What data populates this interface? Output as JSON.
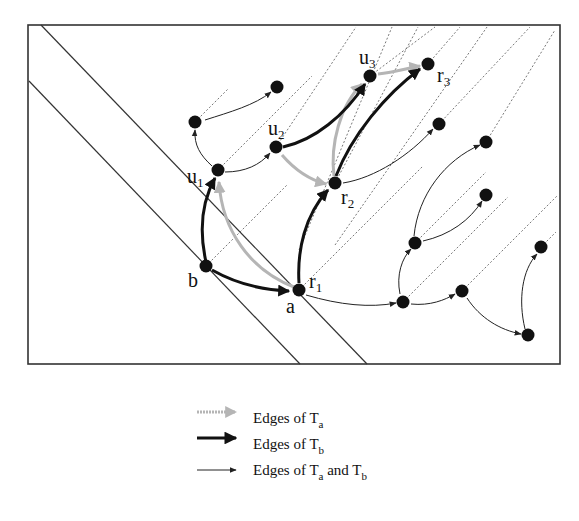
{
  "diagram": {
    "frame": {
      "x": 28,
      "y": 25,
      "w": 532,
      "h": 339
    },
    "colors": {
      "node": "#111111",
      "frame": "#333333",
      "gray_edge": "#b5b5b5",
      "black_edge": "#111111",
      "thin_edge": "#222222",
      "dotted": "#555555"
    },
    "nodes": [
      {
        "id": "b",
        "x": 206,
        "y": 266,
        "label": "b",
        "lx": 188,
        "ly": 287
      },
      {
        "id": "a",
        "x": 299,
        "y": 290,
        "label": "a",
        "lx": 286,
        "ly": 313
      },
      {
        "id": "r1",
        "x": 299,
        "y": 290,
        "label": "r",
        "sub": "1",
        "lx": 309,
        "ly": 288
      },
      {
        "id": "u1",
        "x": 218,
        "y": 170,
        "label": "u",
        "sub": "1",
        "lx": 187,
        "ly": 183
      },
      {
        "id": "u2",
        "x": 276,
        "y": 147,
        "label": "u",
        "sub": "2",
        "lx": 268,
        "ly": 135
      },
      {
        "id": "r2",
        "x": 335,
        "y": 183,
        "label": "r",
        "sub": "2",
        "lx": 341,
        "ly": 204
      },
      {
        "id": "u3",
        "x": 370,
        "y": 76,
        "label": "u",
        "sub": "3",
        "lx": 359,
        "ly": 64
      },
      {
        "id": "r3",
        "x": 428,
        "y": 64,
        "label": "r",
        "sub": "3",
        "lx": 437,
        "ly": 82
      },
      {
        "id": "n1",
        "x": 195,
        "y": 122
      },
      {
        "id": "n2",
        "x": 277,
        "y": 87
      },
      {
        "id": "n3",
        "x": 439,
        "y": 124
      },
      {
        "id": "n4",
        "x": 486,
        "y": 142
      },
      {
        "id": "n5",
        "x": 486,
        "y": 195
      },
      {
        "id": "n6",
        "x": 415,
        "y": 243
      },
      {
        "id": "n7",
        "x": 403,
        "y": 302
      },
      {
        "id": "n8",
        "x": 462,
        "y": 291
      },
      {
        "id": "n9",
        "x": 541,
        "y": 247
      },
      {
        "id": "n10",
        "x": 528,
        "y": 335
      }
    ],
    "solid_diagonals": [
      {
        "x1": 41,
        "y1": 25,
        "x2": 367,
        "y2": 364
      },
      {
        "x1": 29,
        "y1": 81,
        "x2": 300,
        "y2": 364
      }
    ],
    "dotted_diagonals": [
      {
        "x1": 195,
        "y1": 122,
        "x2": 228,
        "y2": 89
      },
      {
        "x1": 206,
        "y1": 266,
        "x2": 287,
        "y2": 185
      },
      {
        "x1": 218,
        "y1": 170,
        "x2": 312,
        "y2": 76
      },
      {
        "x1": 276,
        "y1": 147,
        "x2": 356,
        "y2": 27
      },
      {
        "x1": 299,
        "y1": 290,
        "x2": 423,
        "y2": 166
      },
      {
        "x1": 335,
        "y1": 183,
        "x2": 418,
        "y2": 27
      },
      {
        "x1": 299,
        "y1": 250,
        "x2": 392,
        "y2": 27
      },
      {
        "x1": 370,
        "y1": 76,
        "x2": 435,
        "y2": 27
      },
      {
        "x1": 428,
        "y1": 64,
        "x2": 460,
        "y2": 27
      },
      {
        "x1": 335,
        "y1": 245,
        "x2": 487,
        "y2": 27
      },
      {
        "x1": 439,
        "y1": 124,
        "x2": 530,
        "y2": 27
      },
      {
        "x1": 486,
        "y1": 142,
        "x2": 555,
        "y2": 30
      },
      {
        "x1": 415,
        "y1": 243,
        "x2": 486,
        "y2": 172
      },
      {
        "x1": 403,
        "y1": 302,
        "x2": 508,
        "y2": 197
      },
      {
        "x1": 462,
        "y1": 291,
        "x2": 557,
        "y2": 196
      },
      {
        "x1": 541,
        "y1": 247,
        "x2": 556,
        "y2": 232
      }
    ],
    "edges_black": [
      {
        "d": "M206,262 C200,235 200,205 215,178"
      },
      {
        "d": "M212,270 C235,283 262,290 289,291"
      },
      {
        "d": "M299,283 C297,250 305,215 328,190"
      },
      {
        "d": "M283,147 C315,140 345,115 365,84"
      },
      {
        "d": "M336,176 C352,135 385,95 420,69"
      }
    ],
    "edges_gray": [
      {
        "d": "M294,287 C250,270 222,230 219,182"
      },
      {
        "d": "M282,155 C295,170 310,180 326,184"
      },
      {
        "d": "M334,176 C330,145 340,105 362,84"
      },
      {
        "d": "M378,74 C395,72 408,68 420,66"
      }
    ],
    "edges_thin": [
      {
        "d": "M212,166 C200,155 194,145 195,130"
      },
      {
        "d": "M205,120 C230,112 255,105 271,92"
      },
      {
        "d": "M225,172 C245,172 260,165 270,153"
      },
      {
        "d": "M343,183 C375,178 410,155 433,129"
      },
      {
        "d": "M306,295 C340,305 370,308 396,303"
      },
      {
        "d": "M400,294 C396,275 402,258 411,249"
      },
      {
        "d": "M414,236 C418,195 445,160 480,145"
      },
      {
        "d": "M423,241 C450,235 470,220 482,201"
      },
      {
        "d": "M411,304 C430,306 445,300 455,294"
      },
      {
        "d": "M467,298 C480,318 500,330 521,334"
      },
      {
        "d": "M525,329 C518,300 522,270 537,254"
      }
    ]
  },
  "legend": {
    "items": [
      {
        "label": "Edges of T",
        "sub": "a",
        "style": "gray"
      },
      {
        "label": "Edges of T",
        "sub": "b",
        "style": "black"
      },
      {
        "label": "Edges of T",
        "sub": "a",
        "label2": " and T",
        "sub2": "b",
        "style": "thin"
      }
    ]
  }
}
